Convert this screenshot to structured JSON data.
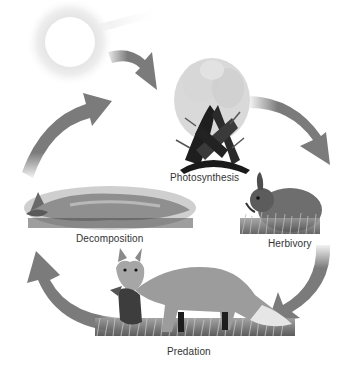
{
  "diagram": {
    "colors": {
      "background": "#ffffff",
      "arrow": "#7b7b7b",
      "label_text": "#333333",
      "sun_core": "#ffffff",
      "sun_halo": "#cfcfcf"
    },
    "nodes": [
      {
        "id": "sun",
        "label": "",
        "icon": "sun-icon"
      },
      {
        "id": "photosynthesis",
        "label": "Photosynthesis",
        "icon": "plant-image"
      },
      {
        "id": "herbivory",
        "label": "Herbivory",
        "icon": "rabbit-image"
      },
      {
        "id": "predation",
        "label": "Predation",
        "icon": "fox-with-prey-image"
      },
      {
        "id": "decomposition",
        "label": "Decomposition",
        "icon": "dead-fox-image"
      }
    ],
    "arrows": [
      {
        "from": "sun",
        "to": "photosynthesis"
      },
      {
        "from": "photosynthesis",
        "to": "herbivory"
      },
      {
        "from": "herbivory",
        "to": "predation"
      },
      {
        "from": "predation",
        "to": "decomposition"
      },
      {
        "from": "decomposition",
        "to": "sun"
      }
    ]
  }
}
